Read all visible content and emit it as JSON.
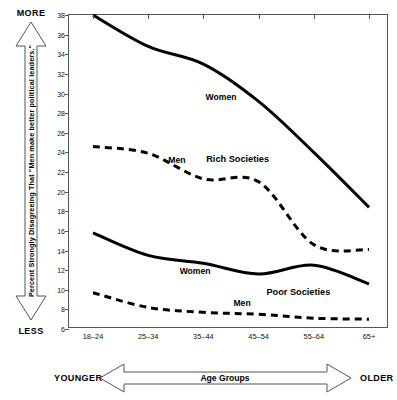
{
  "chart_data": {
    "type": "line",
    "title": "",
    "subtitle": "",
    "xlabel": "Age Groups",
    "ylabel": "Percent Strongly Disagreeing That \"Men make better political leaders.\"",
    "categories": [
      "18–24",
      "25–34",
      "35–44",
      "45–54",
      "55–64",
      "65+"
    ],
    "x": [
      0,
      1,
      2,
      3,
      4,
      5
    ],
    "ylim": [
      6,
      38
    ],
    "yticks": [
      6,
      8,
      10,
      12,
      14,
      16,
      18,
      20,
      22,
      24,
      26,
      28,
      30,
      32,
      34,
      36,
      38
    ],
    "ytick_labels": [
      "6",
      "8",
      "10",
      "12",
      "14",
      "16",
      "18",
      "20",
      "22",
      "24",
      "26",
      "28",
      "30",
      "32",
      "34",
      "36",
      "38"
    ],
    "grid": false,
    "legend": "inline-annotations",
    "series": [
      {
        "name": "Women",
        "group": "Rich Societies",
        "style": "solid",
        "color": "#000000",
        "values": [
          38.0,
          34.8,
          33.0,
          29.2,
          24.0,
          18.4
        ]
      },
      {
        "name": "Men",
        "group": "Rich Societies",
        "style": "dashed",
        "color": "#000000",
        "values": [
          24.6,
          23.9,
          21.3,
          21.0,
          14.6,
          14.1
        ]
      },
      {
        "name": "Women",
        "group": "Poor Societies",
        "style": "solid",
        "color": "#000000",
        "values": [
          15.8,
          13.5,
          12.7,
          11.6,
          12.5,
          10.6
        ]
      },
      {
        "name": "Men",
        "group": "Poor Societies",
        "style": "dashed",
        "color": "#000000",
        "values": [
          9.7,
          8.2,
          7.7,
          7.5,
          7.1,
          7.0
        ]
      }
    ],
    "annotations": [
      {
        "text": "Women",
        "x": 2.32,
        "y": 29.6
      },
      {
        "text": "Men",
        "x": 1.52,
        "y": 23.2
      },
      {
        "text": "Rich Societies",
        "x": 2.62,
        "y": 23.3
      },
      {
        "text": "Women",
        "x": 1.85,
        "y": 11.9
      },
      {
        "text": "Men",
        "x": 2.7,
        "y": 8.6
      },
      {
        "text": "Poor Societies",
        "x": 3.72,
        "y": 9.8
      }
    ]
  },
  "y_axis_arrow": {
    "top_label": "MORE",
    "bottom_label": "LESS",
    "caption": "Percent Strongly Disagreeing That \"Men make better political leaders.\""
  },
  "x_axis_arrow": {
    "left_label": "YOUNGER",
    "right_label": "OLDER",
    "caption": "Age Groups"
  }
}
